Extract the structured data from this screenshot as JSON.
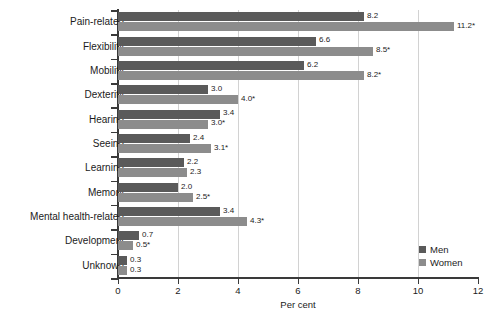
{
  "chart_data": {
    "type": "bar",
    "orientation": "horizontal",
    "title": "",
    "subtitle": "",
    "xlabel": "Per cent",
    "ylabel": "",
    "xlim": [
      0,
      12
    ],
    "xticks": [
      0,
      2,
      4,
      6,
      8,
      10,
      12
    ],
    "xtick_labels": [
      "0",
      "2",
      "4",
      "6",
      "8",
      "10",
      "12"
    ],
    "grid": "vertical",
    "legend_position": "bottom-right",
    "categories": [
      "Pain-related",
      "Flexibility",
      "Mobility",
      "Dexterity",
      "Hearing",
      "Seeing",
      "Learning",
      "Memory",
      "Mental health-related",
      "Development",
      "Unknown"
    ],
    "series": [
      {
        "name": "Men",
        "color": "#5a5a5a",
        "values": [
          8.2,
          6.6,
          6.2,
          3.0,
          3.4,
          2.4,
          2.2,
          2.0,
          3.4,
          0.7,
          0.3
        ],
        "labels": [
          "8.2",
          "6.6",
          "6.2",
          "3.0",
          "3.4",
          "2.4",
          "2.2",
          "2.0",
          "3.4",
          "0.7",
          "0.3"
        ]
      },
      {
        "name": "Women",
        "color": "#8c8c8c",
        "values": [
          11.2,
          8.5,
          8.2,
          4.0,
          3.0,
          3.1,
          2.3,
          2.5,
          4.3,
          0.5,
          0.3
        ],
        "labels": [
          "11.2*",
          "8.5*",
          "8.2*",
          "4.0*",
          "3.0*",
          "3.1*",
          "2.3",
          "2.5*",
          "4.3*",
          "0.5*",
          "0.3"
        ]
      }
    ]
  },
  "legend": {
    "items": [
      {
        "label": "Men",
        "color": "#5a5a5a"
      },
      {
        "label": "Women",
        "color": "#8c8c8c"
      }
    ]
  }
}
